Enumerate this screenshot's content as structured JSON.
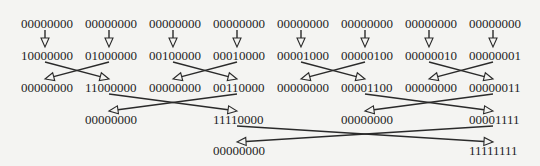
{
  "diagram": {
    "colors": {
      "background": "#f4f4f2",
      "text": "#1e1e1e",
      "edge": "#2a2a2a"
    },
    "nodes": [
      {
        "id": "r0c0",
        "label": "00000000",
        "x": 21,
        "y": 17
      },
      {
        "id": "r0c1",
        "label": "00000000",
        "x": 85,
        "y": 17
      },
      {
        "id": "r0c2",
        "label": "00000000",
        "x": 149,
        "y": 17
      },
      {
        "id": "r0c3",
        "label": "00000000",
        "x": 213,
        "y": 17
      },
      {
        "id": "r0c4",
        "label": "00000000",
        "x": 277,
        "y": 17
      },
      {
        "id": "r0c5",
        "label": "00000000",
        "x": 341,
        "y": 17
      },
      {
        "id": "r0c6",
        "label": "00000000",
        "x": 405,
        "y": 17
      },
      {
        "id": "r0c7",
        "label": "00000000",
        "x": 469,
        "y": 17
      },
      {
        "id": "r1c0",
        "label": "10000000",
        "x": 21,
        "y": 49
      },
      {
        "id": "r1c1",
        "label": "01000000",
        "x": 85,
        "y": 49
      },
      {
        "id": "r1c2",
        "label": "00100000",
        "x": 149,
        "y": 49
      },
      {
        "id": "r1c3",
        "label": "00010000",
        "x": 213,
        "y": 49
      },
      {
        "id": "r1c4",
        "label": "00001000",
        "x": 277,
        "y": 49
      },
      {
        "id": "r1c5",
        "label": "00000100",
        "x": 341,
        "y": 49
      },
      {
        "id": "r1c6",
        "label": "00000010",
        "x": 405,
        "y": 49
      },
      {
        "id": "r1c7",
        "label": "00000001",
        "x": 469,
        "y": 49
      },
      {
        "id": "r2c0",
        "label": "00000000",
        "x": 21,
        "y": 81
      },
      {
        "id": "r2c1",
        "label": "11000000",
        "x": 85,
        "y": 81
      },
      {
        "id": "r2c2",
        "label": "00000000",
        "x": 149,
        "y": 81
      },
      {
        "id": "r2c3",
        "label": "00110000",
        "x": 213,
        "y": 81
      },
      {
        "id": "r2c4",
        "label": "00000000",
        "x": 277,
        "y": 81
      },
      {
        "id": "r2c5",
        "label": "00001100",
        "x": 341,
        "y": 81
      },
      {
        "id": "r2c6",
        "label": "00000000",
        "x": 405,
        "y": 81
      },
      {
        "id": "r2c7",
        "label": "00000011",
        "x": 469,
        "y": 81
      },
      {
        "id": "r3c1",
        "label": "00000000",
        "x": 85,
        "y": 113
      },
      {
        "id": "r3c3",
        "label": "11110000",
        "x": 213,
        "y": 113
      },
      {
        "id": "r3c5",
        "label": "00000000",
        "x": 341,
        "y": 113
      },
      {
        "id": "r3c7",
        "label": "00001111",
        "x": 469,
        "y": 113
      },
      {
        "id": "r4c3",
        "label": "00000000",
        "x": 213,
        "y": 144
      },
      {
        "id": "r4c7",
        "label": "11111111",
        "x": 469,
        "y": 144
      }
    ],
    "edges": [
      {
        "x1": 45,
        "y1": 30,
        "x2": 45,
        "y2": 47
      },
      {
        "x1": 109,
        "y1": 30,
        "x2": 109,
        "y2": 47
      },
      {
        "x1": 173,
        "y1": 30,
        "x2": 173,
        "y2": 47
      },
      {
        "x1": 237,
        "y1": 30,
        "x2": 237,
        "y2": 47
      },
      {
        "x1": 301,
        "y1": 30,
        "x2": 301,
        "y2": 47
      },
      {
        "x1": 365,
        "y1": 30,
        "x2": 365,
        "y2": 47
      },
      {
        "x1": 429,
        "y1": 30,
        "x2": 429,
        "y2": 47
      },
      {
        "x1": 493,
        "y1": 30,
        "x2": 493,
        "y2": 47
      },
      {
        "x1": 45,
        "y1": 62,
        "x2": 109,
        "y2": 79
      },
      {
        "x1": 109,
        "y1": 62,
        "x2": 45,
        "y2": 79
      },
      {
        "x1": 173,
        "y1": 62,
        "x2": 237,
        "y2": 79
      },
      {
        "x1": 237,
        "y1": 62,
        "x2": 173,
        "y2": 79
      },
      {
        "x1": 301,
        "y1": 62,
        "x2": 365,
        "y2": 79
      },
      {
        "x1": 365,
        "y1": 62,
        "x2": 301,
        "y2": 79
      },
      {
        "x1": 429,
        "y1": 62,
        "x2": 493,
        "y2": 79
      },
      {
        "x1": 493,
        "y1": 62,
        "x2": 429,
        "y2": 79
      },
      {
        "x1": 109,
        "y1": 94,
        "x2": 237,
        "y2": 111
      },
      {
        "x1": 237,
        "y1": 94,
        "x2": 109,
        "y2": 111
      },
      {
        "x1": 365,
        "y1": 94,
        "x2": 493,
        "y2": 111
      },
      {
        "x1": 493,
        "y1": 94,
        "x2": 365,
        "y2": 111
      },
      {
        "x1": 237,
        "y1": 126,
        "x2": 493,
        "y2": 142
      },
      {
        "x1": 493,
        "y1": 126,
        "x2": 237,
        "y2": 142
      }
    ]
  }
}
